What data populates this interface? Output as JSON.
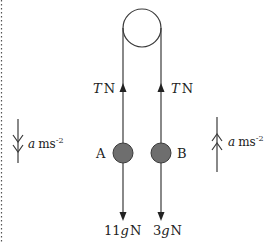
{
  "diagram": {
    "colors": {
      "line": "#3a3a3a",
      "mass_fill": "#6e6e6e",
      "border_dots": "#555555",
      "text": "#222222"
    },
    "pulley": {
      "cx": 142,
      "cy": 28,
      "r": 19
    },
    "strings": {
      "left_x": 123,
      "right_x": 161
    },
    "tension": {
      "left": {
        "symbol": "T",
        "unit": "N"
      },
      "right": {
        "symbol": "T",
        "unit": "N"
      }
    },
    "masses": [
      {
        "id": "A",
        "label": "A",
        "cx": 123,
        "cy": 153,
        "r": 10,
        "weight_coefficient": "11",
        "weight_symbol": "g",
        "weight_unit": "N"
      },
      {
        "id": "B",
        "label": "B",
        "cx": 161,
        "cy": 153,
        "r": 10,
        "weight_coefficient": "3",
        "weight_symbol": "g",
        "weight_unit": "N"
      }
    ],
    "weights": {
      "A": "11gN",
      "B": "3gN"
    },
    "acceleration": {
      "left": {
        "direction": "down",
        "symbol": "a",
        "unit": "ms",
        "exponent": "-2"
      },
      "right": {
        "direction": "up",
        "symbol": "a",
        "unit": "ms",
        "exponent": "-2"
      }
    }
  }
}
